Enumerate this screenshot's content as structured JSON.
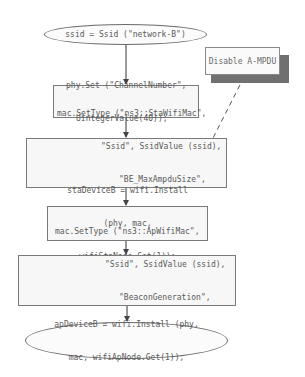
{
  "diagram": {
    "type": "flowchart",
    "nodes": [
      {
        "id": "start",
        "shape": "ellipse",
        "lines": [
          "ssid = Ssid (\"network-B\")"
        ]
      },
      {
        "id": "phy-set",
        "shape": "rect",
        "lines": [
          "phy.Set (\"ChannelNumber\",",
          "UintegerValue(40));"
        ]
      },
      {
        "id": "mac-sta",
        "shape": "rect",
        "lines": [
          "mac.SetType (\"ns3::StaWifiMac\",",
          "\"Ssid\", SsidValue (ssid),",
          "\"BE_MaxAmpduSize\",",
          "UintegerValue (0))"
        ]
      },
      {
        "id": "sta-install",
        "shape": "rect",
        "lines": [
          "staDeviceB = wifi.Install",
          "(phy, mac,",
          "wifiStaNode.Get(1));"
        ]
      },
      {
        "id": "mac-ap",
        "shape": "rect",
        "lines": [
          "mac.SetType (\"ns3::ApWifiMac\",",
          "\"Ssid\", SsidValue (ssid),",
          "\"BeaconGeneration\",",
          "BooleanValue (true));"
        ]
      },
      {
        "id": "end",
        "shape": "ellipse",
        "lines": [
          "apDeviceB = wifi.Install (phy,",
          "mac, wifiApNode.Get(1));"
        ]
      }
    ],
    "note": {
      "text": "Disable A-MPDU",
      "attached_to": "mac-sta",
      "connector": "dashed"
    },
    "edges": [
      {
        "from": "start",
        "to": "phy-set"
      },
      {
        "from": "phy-set",
        "to": "mac-sta"
      },
      {
        "from": "mac-sta",
        "to": "sta-install"
      },
      {
        "from": "sta-install",
        "to": "mac-ap"
      },
      {
        "from": "mac-ap",
        "to": "end"
      }
    ],
    "colors": {
      "border": "#6b6b6b",
      "text": "#5a5a5a",
      "fill": "#f7f7f7",
      "note_shadow": "#707070",
      "arrow": "#444444"
    }
  }
}
